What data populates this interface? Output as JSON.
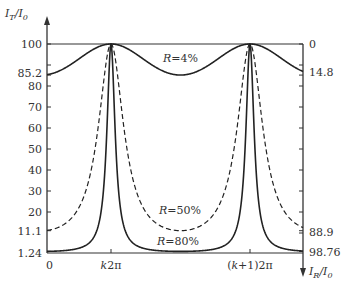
{
  "chart_data": {
    "type": "line",
    "title": "",
    "ylabel_left": "I_T/I_0",
    "ylabel_right": "I_R/I_0",
    "xlabel": "",
    "x_tick_labels": [
      "0",
      "k2π",
      "(k+1)2π"
    ],
    "left_ticks": [
      100,
      90,
      85.2,
      80,
      70,
      60,
      50,
      40,
      30,
      20,
      11.1,
      1.24
    ],
    "left_tick_labels": [
      "100",
      "85.2",
      "80",
      "70",
      "60",
      "50",
      "40",
      "30",
      "20",
      "11.1",
      "1.24"
    ],
    "right_tick_labels": [
      "0",
      "14.8",
      "88.9",
      "98.76"
    ],
    "right_ticks": [
      0,
      14.8,
      88.9,
      98.76
    ],
    "ylim_left": [
      0,
      100
    ],
    "ylim_right": [
      100,
      0
    ],
    "grid": false,
    "series": [
      {
        "name": "R=4%",
        "label": "R=4%",
        "R": 0.04,
        "min_transmission": 85.2,
        "max_transmission": 100,
        "style": "solid"
      },
      {
        "name": "R=50%",
        "label": "R=50%",
        "R": 0.5,
        "min_transmission": 11.1,
        "max_transmission": 100,
        "style": "dashed"
      },
      {
        "name": "R=80%",
        "label": "R=80%",
        "R": 0.8,
        "min_transmission": 1.24,
        "max_transmission": 100,
        "style": "solid"
      }
    ],
    "formula": "I_T/I_0 = 1 / (1 + 4R/(1-R)^2 · sin^2(δ/2))",
    "peaks_at": [
      "k2π",
      "(k+1)2π"
    ]
  },
  "labels": {
    "y_left_I": "I",
    "y_left_sub": "T",
    "y_left_rest": "/I",
    "y_left_sub0": "0",
    "y_right_I": "I",
    "y_right_sub": "R",
    "y_right_rest": "/I",
    "y_right_sub0": "0",
    "origin": "0",
    "k2pi_k": "k",
    "k2pi_rest": "2π",
    "k1_open": "(",
    "k1_k": "k",
    "k1_rest": "+1)2π",
    "r4_R": "R",
    "r4_rest": "=4%",
    "r50_R": "R",
    "r50_rest": "=50%",
    "r80_R": "R",
    "r80_rest": "=80%",
    "l100": "100",
    "l852": "85.2",
    "l80": "80",
    "l70": "70",
    "l60": "60",
    "l50": "50",
    "l40": "40",
    "l30": "30",
    "l20": "20",
    "l111": "11.1",
    "l124": "1.24",
    "r0": "0",
    "r148": "14.8",
    "r889": "88.9",
    "r9876": "98.76"
  }
}
